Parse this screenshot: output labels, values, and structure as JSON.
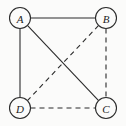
{
  "figure": {
    "type": "graph-diagram",
    "width": 126,
    "height": 126,
    "background_color": "#fbfbfa",
    "ink_color": "#2b2b2b"
  },
  "nodes": [
    {
      "id": "A",
      "label": "A",
      "cx": 20,
      "cy": 18,
      "r": 10.5
    },
    {
      "id": "B",
      "label": "B",
      "cx": 106,
      "cy": 18,
      "r": 10.5
    },
    {
      "id": "C",
      "label": "C",
      "cx": 106,
      "cy": 108,
      "r": 10.5
    },
    {
      "id": "D",
      "label": "D",
      "cx": 20,
      "cy": 108,
      "r": 10.5
    }
  ],
  "edges": [
    {
      "id": "A-B",
      "from": "A",
      "to": "B",
      "style": "solid",
      "x1": 30.5,
      "y1": 18,
      "x2": 95.5,
      "y2": 18
    },
    {
      "id": "A-D",
      "from": "A",
      "to": "D",
      "style": "solid",
      "x1": 20,
      "y1": 28.5,
      "x2": 20,
      "y2": 97.5
    },
    {
      "id": "A-C",
      "from": "A",
      "to": "C",
      "style": "solid",
      "x1": 27.4,
      "y1": 25.4,
      "x2": 98.6,
      "y2": 100.6
    },
    {
      "id": "B-C",
      "from": "B",
      "to": "C",
      "style": "dashed",
      "x1": 106,
      "y1": 28.5,
      "x2": 106,
      "y2": 97.5
    },
    {
      "id": "B-D",
      "from": "B",
      "to": "D",
      "style": "dashed",
      "x1": 98.6,
      "y1": 25.4,
      "x2": 27.4,
      "y2": 100.6
    },
    {
      "id": "D-C",
      "from": "D",
      "to": "C",
      "style": "dashed",
      "x1": 30.5,
      "y1": 108,
      "x2": 95.5,
      "y2": 108
    }
  ]
}
